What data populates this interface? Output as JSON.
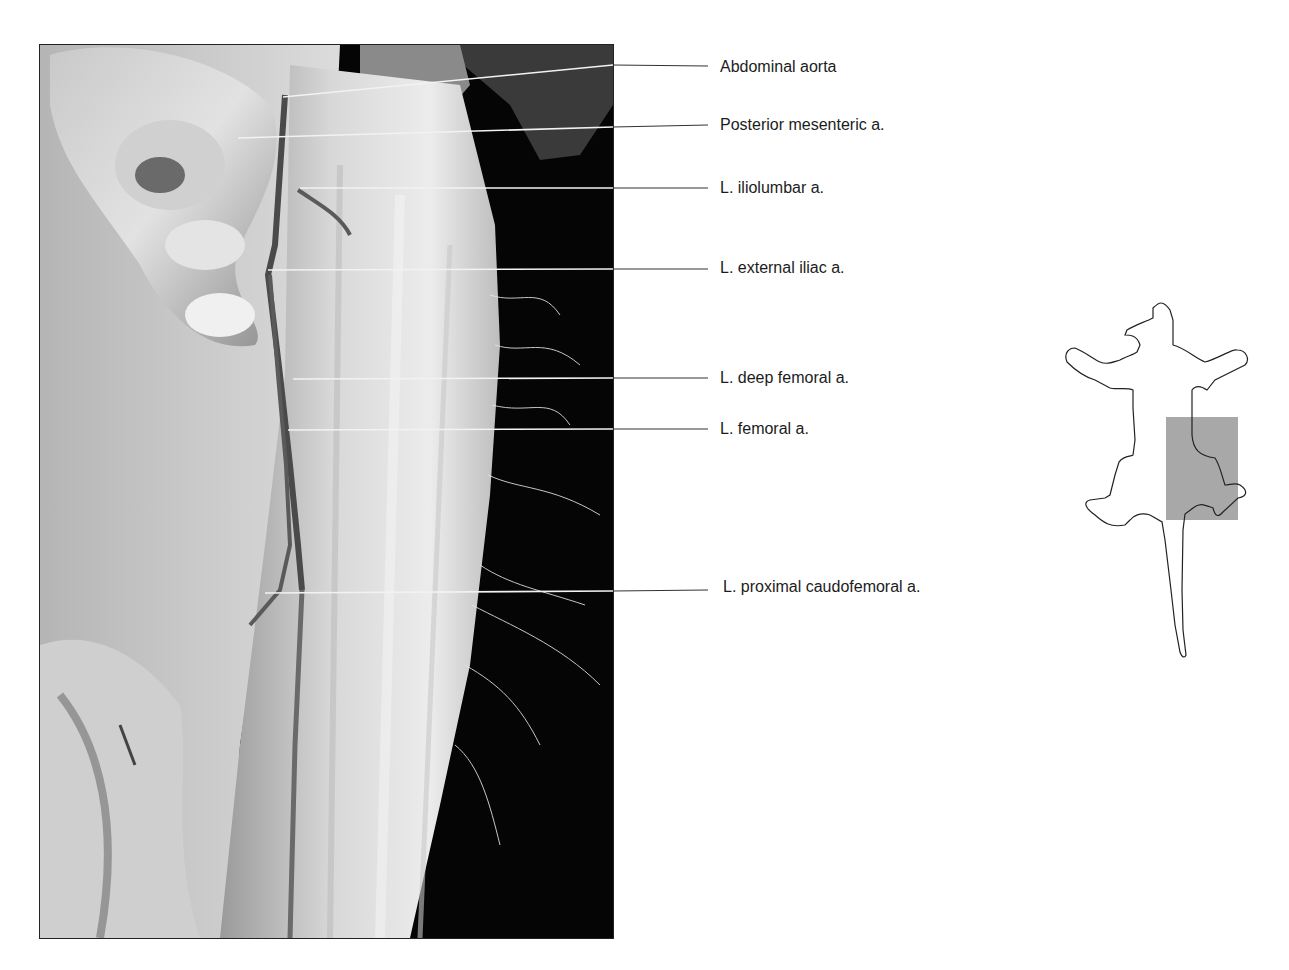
{
  "figure": {
    "photo_description": "Ventral dissection of cat left hindlimb and caudal abdomen showing arteries",
    "labels": [
      {
        "text": "Abdominal aorta",
        "x": 720,
        "y": 58,
        "line_y": 66,
        "target": [
          283,
          97
        ],
        "elbow": [
          605,
          65
        ]
      },
      {
        "text": "Posterior mesenteric a.",
        "x": 720,
        "y": 116,
        "line_y": 125,
        "target": [
          238,
          138
        ],
        "elbow": [
          605,
          127
        ]
      },
      {
        "text": "L. iliolumbar a.",
        "x": 720,
        "y": 179,
        "line_y": 188,
        "target": [
          300,
          188
        ],
        "elbow": [
          605,
          188
        ]
      },
      {
        "text": "L. external iliac a.",
        "x": 720,
        "y": 259,
        "line_y": 269,
        "target": [
          268,
          270
        ],
        "elbow": [
          605,
          269
        ]
      },
      {
        "text": "L. deep femoral a.",
        "x": 720,
        "y": 369,
        "line_y": 378,
        "target": [
          293,
          379
        ],
        "elbow": [
          605,
          378
        ]
      },
      {
        "text": "L. femoral a.",
        "x": 720,
        "y": 420,
        "line_y": 429,
        "target": [
          288,
          430
        ],
        "elbow": [
          605,
          429
        ]
      },
      {
        "text": "L. proximal caudofemoral a.",
        "x": 723,
        "y": 578,
        "line_y": 590,
        "target": [
          265,
          593
        ],
        "elbow": [
          605,
          591
        ]
      }
    ],
    "orientation_icon": {
      "name": "cat-body-outline",
      "highlight_color": "#a8a8a8",
      "outline_color": "#222222"
    },
    "colors": {
      "leader_line": "#333333",
      "label_text": "#1c1c1c",
      "photo_background": "#000000"
    }
  }
}
